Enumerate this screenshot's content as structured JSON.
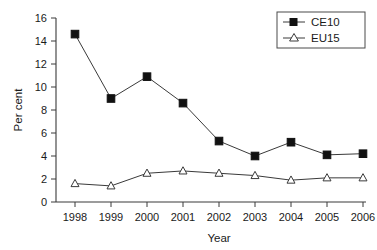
{
  "chart_data": {
    "type": "line",
    "title": "",
    "xlabel": "Year",
    "ylabel": "Per cent",
    "categories": [
      "1998",
      "1999",
      "2000",
      "2001",
      "2002",
      "2003",
      "2004",
      "2005",
      "2006"
    ],
    "x": [
      1998,
      1999,
      2000,
      2001,
      2002,
      2003,
      2004,
      2005,
      2006
    ],
    "series": [
      {
        "name": "CE10",
        "marker": "filled-square",
        "values": [
          14.6,
          9.0,
          10.9,
          8.6,
          5.3,
          4.0,
          5.2,
          4.1,
          4.2
        ]
      },
      {
        "name": "EU15",
        "marker": "open-triangle",
        "values": [
          1.6,
          1.4,
          2.5,
          2.7,
          2.5,
          2.3,
          1.9,
          2.1,
          2.1
        ]
      }
    ],
    "xlim": [
      1997.6,
      2006.6
    ],
    "ylim": [
      0,
      16
    ],
    "yticks": [
      0,
      2,
      4,
      6,
      8,
      10,
      12,
      14,
      16
    ],
    "ytick_labels": [
      "0",
      "2",
      "4",
      "6",
      "8",
      "10",
      "12",
      "14",
      "16"
    ],
    "xtick_labels": [
      "1998",
      "1999",
      "2000",
      "2001",
      "2002",
      "2003",
      "2004",
      "2005",
      "2006"
    ],
    "grid": false,
    "legend": {
      "position": "top-right",
      "entries": [
        {
          "label": "CE10",
          "marker": "filled-square"
        },
        {
          "label": "EU15",
          "marker": "open-triangle"
        }
      ]
    },
    "colors": {
      "line": "#3a3a3a",
      "marker_fill_ce10": "#111111",
      "marker_fill_eu15": "#ffffff",
      "axis": "#3a3a3a",
      "text": "#1a1a1a",
      "background": "#ffffff"
    }
  }
}
